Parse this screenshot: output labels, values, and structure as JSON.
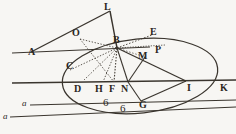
{
  "figure": {
    "width": 236,
    "height": 134,
    "background_color": "#f7f6f3",
    "ink_color": "#3a352e",
    "labels": [
      {
        "id": "A",
        "text": "A",
        "x": 28,
        "y": 47,
        "kind": "cap"
      },
      {
        "id": "L",
        "text": "L",
        "x": 104,
        "y": 4,
        "kind": "cap"
      },
      {
        "id": "O",
        "text": "O",
        "x": 72,
        "y": 30,
        "kind": "cap"
      },
      {
        "id": "B",
        "text": "B",
        "x": 114,
        "y": 37,
        "kind": "cap"
      },
      {
        "id": "E",
        "text": "E",
        "x": 150,
        "y": 29,
        "kind": "cap"
      },
      {
        "id": "P",
        "text": "P",
        "x": 156,
        "y": 46,
        "kind": "cap"
      },
      {
        "id": "M",
        "text": "M",
        "x": 139,
        "y": 52,
        "kind": "cap"
      },
      {
        "id": "C",
        "text": "C",
        "x": 67,
        "y": 62,
        "kind": "cap"
      },
      {
        "id": "D",
        "text": "D",
        "x": 74,
        "y": 82,
        "kind": "cap"
      },
      {
        "id": "H",
        "text": "H",
        "x": 95,
        "y": 82,
        "kind": "cap"
      },
      {
        "id": "F",
        "text": "F",
        "x": 109,
        "y": 82,
        "kind": "cap"
      },
      {
        "id": "N",
        "text": "N",
        "x": 122,
        "y": 82,
        "kind": "cap"
      },
      {
        "id": "G",
        "text": "G",
        "x": 140,
        "y": 96,
        "kind": "cap"
      },
      {
        "id": "I",
        "text": "I",
        "x": 188,
        "y": 82,
        "kind": "cap"
      },
      {
        "id": "K",
        "text": "K",
        "x": 220,
        "y": 82,
        "kind": "cap"
      },
      {
        "id": "a1",
        "text": "a",
        "x": 22,
        "y": 106,
        "kind": "small"
      },
      {
        "id": "a2",
        "text": "a",
        "x": 3,
        "y": 119,
        "kind": "small"
      },
      {
        "id": "six1",
        "text": "6",
        "x": 103,
        "y": 101,
        "kind": "six"
      },
      {
        "id": "six2",
        "text": "6",
        "x": 120,
        "y": 107,
        "kind": "six"
      }
    ],
    "points": {
      "A": [
        31,
        52
      ],
      "L": [
        110,
        11
      ],
      "O": [
        80,
        39
      ],
      "B": [
        117,
        48
      ],
      "E": [
        152,
        34
      ],
      "P": [
        160,
        52
      ],
      "M": [
        145,
        57
      ],
      "C": [
        74,
        66
      ],
      "D": [
        82,
        82
      ],
      "H": [
        103,
        82
      ],
      "F": [
        114,
        82
      ],
      "N": [
        128,
        82
      ],
      "G": [
        141,
        101
      ],
      "I": [
        186,
        81
      ],
      "K": [
        216,
        81
      ]
    },
    "ellipse": {
      "cx": 140,
      "cy": 76,
      "rx": 78,
      "ry": 37,
      "rotation": -6
    },
    "solid_lines": [
      {
        "name": "A-L",
        "from": "A",
        "to": "L"
      },
      {
        "name": "L-B",
        "from": "L",
        "to": "B"
      },
      {
        "name": "A-B-axis",
        "from": [
          12,
          53
        ],
        "to": [
          150,
          47
        ]
      },
      {
        "name": "B-I",
        "from": "B",
        "to": "I"
      },
      {
        "name": "N-M",
        "from": "N",
        "to": "M"
      },
      {
        "name": "N-G",
        "from": "N",
        "to": "G"
      },
      {
        "name": "G-I",
        "from": "G",
        "to": "I"
      },
      {
        "name": "B-N",
        "from": "B",
        "to": "N"
      },
      {
        "name": "main-axis",
        "from": [
          12,
          83
        ],
        "to": [
          236,
          80
        ]
      },
      {
        "name": "lower-line-1",
        "from": [
          30,
          105
        ],
        "to": [
          236,
          100
        ]
      },
      {
        "name": "lower-line-2",
        "from": [
          10,
          117
        ],
        "to": [
          236,
          108
        ]
      }
    ],
    "dotted_lines": [
      {
        "name": "O-B",
        "from": "O",
        "to": "B"
      },
      {
        "name": "O-F",
        "from": "O",
        "to": "F"
      },
      {
        "name": "C-B",
        "from": "C",
        "to": "B"
      },
      {
        "name": "B-E",
        "from": "B",
        "to": "E"
      },
      {
        "name": "B-P",
        "from": "B",
        "to": "P"
      },
      {
        "name": "B-H",
        "from": "B",
        "to": "H"
      },
      {
        "name": "B-F",
        "from": "B",
        "to": "F"
      },
      {
        "name": "B-D",
        "from": "B",
        "to": "D"
      },
      {
        "name": "M-N-dash",
        "from": "M",
        "to": "N"
      }
    ]
  }
}
